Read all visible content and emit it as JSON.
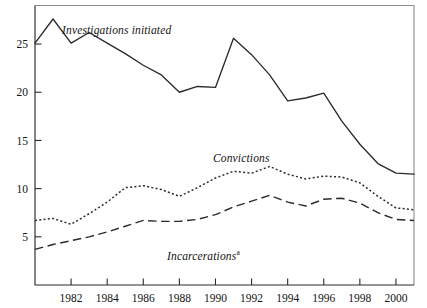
{
  "chart_data": {
    "type": "line",
    "title": "",
    "subtitle": "",
    "xlabel": "",
    "ylabel": "",
    "xlim": [
      1980,
      2001
    ],
    "ylim": [
      0,
      29
    ],
    "grid": false,
    "legend_position": "inline-annotations",
    "x": [
      1980,
      1981,
      1982,
      1983,
      1984,
      1985,
      1986,
      1987,
      1988,
      1989,
      1990,
      1991,
      1992,
      1993,
      1994,
      1995,
      1996,
      1997,
      1998,
      1999,
      2000,
      2001
    ],
    "xticks": [
      1982,
      1984,
      1986,
      1988,
      1990,
      1992,
      1994,
      1996,
      1998,
      2000
    ],
    "xticklabels": [
      "1982",
      "1984",
      "1986",
      "1988",
      "1990",
      "1992",
      "1994",
      "1996",
      "1998",
      "2000"
    ],
    "yticks": [
      5,
      10,
      15,
      20,
      25
    ],
    "yticklabels": [
      "5",
      "10",
      "15",
      "20",
      "25"
    ],
    "series": [
      {
        "name": "Investigations initiated",
        "style": "solid",
        "label_text": "Investigations initiated",
        "values": [
          25.1,
          27.6,
          25.1,
          26.2,
          25.1,
          24.0,
          22.8,
          21.8,
          20.0,
          20.6,
          20.5,
          25.6,
          23.9,
          21.8,
          19.1,
          19.4,
          19.9,
          17.0,
          14.6,
          12.6,
          11.6,
          11.5
        ]
      },
      {
        "name": "Convictions",
        "style": "dotted",
        "label_text": "Convictions",
        "values": [
          6.7,
          6.9,
          6.3,
          7.4,
          8.6,
          10.1,
          10.3,
          9.9,
          9.2,
          10.1,
          11.1,
          11.8,
          11.6,
          12.3,
          11.5,
          11.0,
          11.3,
          11.2,
          10.6,
          9.2,
          8.0,
          7.8
        ]
      },
      {
        "name": "Incarcerations",
        "style": "dashed",
        "label_text": "Incarcerations",
        "label_superscript": "a",
        "values": [
          3.7,
          4.2,
          4.6,
          5.0,
          5.5,
          6.1,
          6.7,
          6.6,
          6.6,
          6.8,
          7.3,
          8.1,
          8.7,
          9.3,
          8.6,
          8.2,
          8.9,
          9.0,
          8.5,
          7.5,
          6.8,
          6.7
        ]
      }
    ],
    "colors": {
      "series_line": "#2b2b2b",
      "axis": "#2a2a2a",
      "frame": "#8e8e8e",
      "background": "#ffffff",
      "text": "#141414"
    }
  }
}
